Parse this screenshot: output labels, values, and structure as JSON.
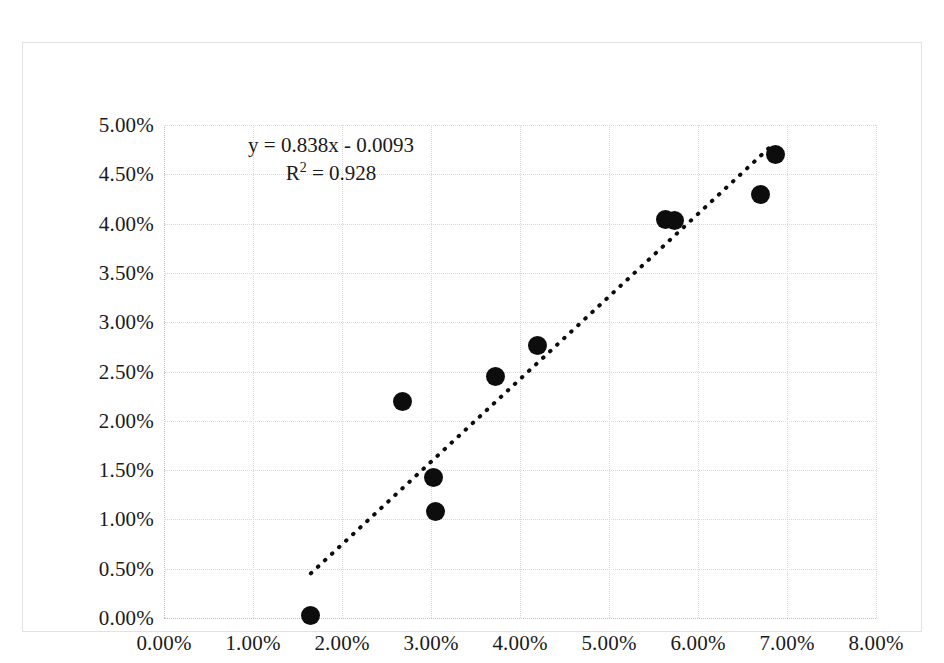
{
  "chart_data": {
    "type": "scatter",
    "title": "",
    "xlabel": "",
    "ylabel": "",
    "xlim": [
      0.0,
      8.0
    ],
    "ylim": [
      0.0,
      5.0
    ],
    "grid": true,
    "legend": "none",
    "x_tick_labels": [
      "0.00%",
      "1.00%",
      "2.00%",
      "3.00%",
      "4.00%",
      "5.00%",
      "6.00%",
      "7.00%",
      "8.00%"
    ],
    "x_tick_values": [
      0.0,
      1.0,
      2.0,
      3.0,
      4.0,
      5.0,
      6.0,
      7.0,
      8.0
    ],
    "y_tick_labels": [
      "0.00%",
      "0.50%",
      "1.00%",
      "1.50%",
      "2.00%",
      "2.50%",
      "3.00%",
      "3.50%",
      "4.00%",
      "4.50%",
      "5.00%"
    ],
    "y_tick_values": [
      0.0,
      0.5,
      1.0,
      1.5,
      2.0,
      2.5,
      3.0,
      3.5,
      4.0,
      4.5,
      5.0
    ],
    "units": "percent",
    "marker_color": "#0d0d0d",
    "points": [
      {
        "x": 1.65,
        "y": 0.03
      },
      {
        "x": 2.68,
        "y": 2.2
      },
      {
        "x": 3.03,
        "y": 1.43
      },
      {
        "x": 3.05,
        "y": 1.08
      },
      {
        "x": 3.72,
        "y": 2.45
      },
      {
        "x": 4.2,
        "y": 2.76
      },
      {
        "x": 5.63,
        "y": 4.04
      },
      {
        "x": 5.74,
        "y": 4.03
      },
      {
        "x": 6.7,
        "y": 4.3
      },
      {
        "x": 6.87,
        "y": 4.7
      }
    ],
    "trendline": {
      "type": "linear",
      "slope": 0.838,
      "intercept": -0.93,
      "style": "dotted",
      "color": "#0d0d0d",
      "x_start": 1.65,
      "x_end": 6.8
    },
    "annotations": {
      "equation": "y = 0.838x - 0.0093",
      "r_squared_prefix": "R",
      "r_squared_exponent": "2",
      "r_squared_value": " = 0.928"
    }
  }
}
